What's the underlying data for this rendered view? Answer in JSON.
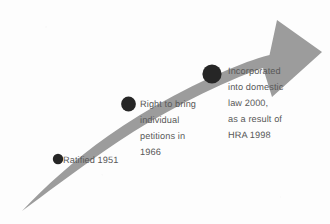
{
  "diagram": {
    "type": "curved-arrow-timeline",
    "title": "",
    "background_color": "#fdfdfd",
    "arrow": {
      "name": "upward-curving-arrow",
      "fill_color": "#9c9c9c",
      "direction": "left-to-right-ascending",
      "tail_point": [
        22,
        211
      ],
      "tip_point": [
        322,
        52
      ]
    },
    "text_color": "#585858",
    "marker_color": "#262626",
    "milestones": [
      {
        "id": "ratified",
        "label": "Ratified 1951",
        "year": "1951",
        "marker": {
          "cx": 58,
          "cy": 159,
          "r": 5.2
        },
        "label_x": 63,
        "label_y": 152
      },
      {
        "id": "petitions",
        "label": "Right to bring\nindividual\npetitions in\n1966",
        "year": "1966",
        "marker": {
          "cx": 128.5,
          "cy": 104,
          "r": 7.4
        },
        "label_x": 140,
        "label_y": 96
      },
      {
        "id": "incorporated",
        "label": "Incorporated\ninto domestic\nlaw 2000,\nas a result of\nHRA 1998",
        "year": "2000",
        "marker": {
          "cx": 212,
          "cy": 74,
          "r": 9.6
        },
        "label_x": 228,
        "label_y": 63
      }
    ]
  },
  "chart_data": {
    "type": "timeline",
    "title": "",
    "categories": [
      "Ratified 1951",
      "Right to bring individual petitions in 1966",
      "Incorporated into domestic law 2000, as a result of HRA 1998"
    ],
    "values": [
      1951,
      1966,
      2000
    ],
    "xlabel": "",
    "ylabel": "",
    "legend": []
  }
}
